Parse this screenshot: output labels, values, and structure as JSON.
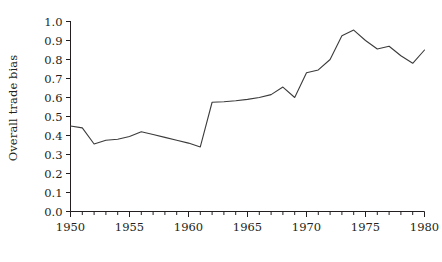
{
  "chart": {
    "ylabel": "Overall trade bias",
    "xlabel": "",
    "title": ""
  },
  "axis": {
    "y_ticks": [
      "0.0",
      "0.1",
      "0.2",
      "0.3",
      "0.4",
      "0.5",
      "0.6",
      "0.7",
      "0.8",
      "0.9",
      "1.0"
    ],
    "x_ticks": [
      "1950",
      "1955",
      "1960",
      "1965",
      "1970",
      "1975",
      "1980"
    ]
  },
  "style": {
    "line_color": "#3b3b3b",
    "axis_color": "#231f20",
    "background": "#ffffff"
  },
  "chart_data": {
    "type": "line",
    "title": "",
    "xlabel": "",
    "ylabel": "Overall trade bias",
    "xlim": [
      1950,
      1980
    ],
    "ylim": [
      0.0,
      1.0
    ],
    "grid": false,
    "legend": false,
    "x_tick_labels": [
      "1950",
      "1955",
      "1960",
      "1965",
      "1970",
      "1975",
      "1980"
    ],
    "y_tick_labels": [
      "0.0",
      "0.1",
      "0.2",
      "0.3",
      "0.4",
      "0.5",
      "0.6",
      "0.7",
      "0.8",
      "0.9",
      "1.0"
    ],
    "x_tick_interval": 1,
    "x_label_interval": 5,
    "x": [
      1950,
      1951,
      1952,
      1953,
      1954,
      1955,
      1956,
      1957,
      1958,
      1959,
      1960,
      1961,
      1962,
      1963,
      1964,
      1965,
      1966,
      1967,
      1968,
      1969,
      1970,
      1971,
      1972,
      1973,
      1974,
      1975,
      1976,
      1977,
      1978,
      1979,
      1980
    ],
    "series": [
      {
        "name": "Overall trade bias",
        "values": [
          0.45,
          0.44,
          0.355,
          0.375,
          0.38,
          0.395,
          0.42,
          0.405,
          0.39,
          0.375,
          0.36,
          0.34,
          0.575,
          0.578,
          0.583,
          0.59,
          0.6,
          0.615,
          0.655,
          0.6,
          0.73,
          0.745,
          0.8,
          0.925,
          0.955,
          0.9,
          0.855,
          0.87,
          0.82,
          0.78,
          0.85
        ]
      }
    ]
  }
}
